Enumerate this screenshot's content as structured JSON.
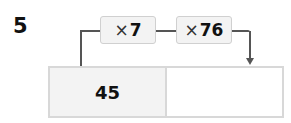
{
  "problem": {
    "number": "5",
    "operations": [
      {
        "symbol": "×",
        "value": "7"
      },
      {
        "symbol": "×",
        "value": "76"
      }
    ],
    "table": {
      "input": "45",
      "output": ""
    }
  }
}
